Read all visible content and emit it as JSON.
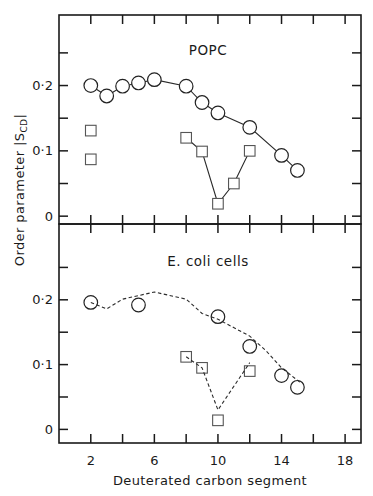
{
  "chart_data": {
    "type": "scatter",
    "xlabel": "Deuterated carbon segment",
    "ylabel": "Order parameter |S",
    "ylabel_subscript": "CD",
    "ylabel_suffix": "|",
    "x_ticks": [
      2,
      6,
      10,
      14,
      18
    ],
    "x_minor_ticks": [
      2,
      4,
      6,
      8,
      10,
      12,
      14,
      16,
      18
    ],
    "xlim": [
      0,
      19
    ],
    "panels": [
      {
        "id": "top",
        "label": "POPC",
        "ylim": [
          -0.012,
          0.308
        ],
        "y_ticks": [
          {
            "value": 0,
            "label": "0"
          },
          {
            "value": 0.1,
            "label": "0·1"
          },
          {
            "value": 0.2,
            "label": "0·2"
          }
        ],
        "y_minor_ticks": [
          0,
          0.05,
          0.1,
          0.15,
          0.2,
          0.25
        ],
        "series": [
          {
            "name": "circles",
            "marker": "circle",
            "line": "solid",
            "x": [
              2,
              3,
              4,
              5,
              6,
              8,
              9,
              10,
              12,
              14,
              15
            ],
            "y": [
              0.2,
              0.184,
              0.199,
              0.204,
              0.209,
              0.199,
              0.174,
              0.158,
              0.136,
              0.093,
              0.07
            ]
          },
          {
            "name": "squares-isolated",
            "marker": "square",
            "line": "none",
            "x": [
              2,
              2
            ],
            "y": [
              0.131,
              0.087
            ]
          },
          {
            "name": "squares",
            "marker": "square",
            "line": "solid",
            "x": [
              8,
              9,
              10,
              11,
              12
            ],
            "y": [
              0.12,
              0.099,
              0.019,
              0.05,
              0.1
            ]
          }
        ]
      },
      {
        "id": "bottom",
        "label": "E. coli cells",
        "ylim": [
          -0.021,
          0.317
        ],
        "y_ticks": [
          {
            "value": 0,
            "label": "0"
          },
          {
            "value": 0.1,
            "label": "0·1"
          },
          {
            "value": 0.2,
            "label": "0·2"
          }
        ],
        "y_minor_ticks": [
          0,
          0.05,
          0.1,
          0.15,
          0.2,
          0.25
        ],
        "series": [
          {
            "name": "circles",
            "marker": "circle",
            "line": "none",
            "x": [
              2,
              5,
              10,
              12,
              14,
              15
            ],
            "y": [
              0.196,
              0.192,
              0.174,
              0.128,
              0.083,
              0.065
            ]
          },
          {
            "name": "circles-fit-curve",
            "marker": "none",
            "line": "dashed",
            "x": [
              2,
              3,
              4,
              6,
              8,
              9,
              10,
              12,
              13,
              14,
              15.2
            ],
            "y": [
              0.196,
              0.186,
              0.201,
              0.212,
              0.201,
              0.179,
              0.17,
              0.144,
              0.122,
              0.095,
              0.072
            ]
          },
          {
            "name": "squares",
            "marker": "square",
            "line": "none",
            "x": [
              8,
              9,
              10,
              12
            ],
            "y": [
              0.112,
              0.095,
              0.014,
              0.09
            ]
          },
          {
            "name": "squares-fit-curve",
            "marker": "none",
            "line": "dashed",
            "x": [
              8,
              9,
              10,
              12
            ],
            "y": [
              0.112,
              0.095,
              0.03,
              0.103
            ]
          }
        ]
      }
    ]
  }
}
